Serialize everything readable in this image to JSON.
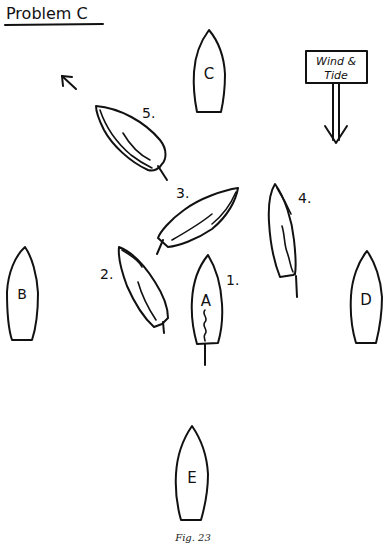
{
  "title": "Problem C",
  "caption": "Fig. 23",
  "wind_sign": {
    "line1": "Wind &",
    "line2": "Tide",
    "icon": "arrow-down-icon"
  },
  "direction_arrow": {
    "icon": "arrow-up-left-icon"
  },
  "marks": [
    {
      "id": "A",
      "label": "A"
    },
    {
      "id": "B",
      "label": "B"
    },
    {
      "id": "C",
      "label": "C"
    },
    {
      "id": "D",
      "label": "D"
    },
    {
      "id": "E",
      "label": "E"
    }
  ],
  "yachts": [
    {
      "id": "1",
      "label": "1."
    },
    {
      "id": "2",
      "label": "2."
    },
    {
      "id": "3",
      "label": "3."
    },
    {
      "id": "4",
      "label": "4."
    },
    {
      "id": "5",
      "label": "5."
    }
  ],
  "colors": {
    "ink": "#111111",
    "background": "#ffffff"
  }
}
